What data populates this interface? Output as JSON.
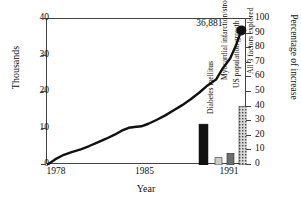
{
  "chart_data": {
    "type": "line",
    "title": "",
    "xlabel": "Year",
    "ylabel": "Thousands",
    "ylabel_right": "Percentage of increase",
    "xlim": [
      1978,
      1992.2
    ],
    "ylim": [
      0,
      40
    ],
    "ylim_right": [
      0,
      100
    ],
    "yticks": [
      0,
      10,
      20,
      30,
      40
    ],
    "yticks_right": [
      0,
      10,
      20,
      30,
      40,
      50,
      60,
      70,
      80,
      90,
      100
    ],
    "xticks": [
      1978,
      1985,
      1991
    ],
    "xtick_labels": [
      "1978",
      "1985",
      "1991"
    ],
    "grid": false,
    "legend": "none",
    "series": [
      {
        "name": "Count (thousands)",
        "axis": "left",
        "marker_end": true,
        "end_label": "36,881",
        "x": [
          1978,
          1978.6,
          1979.2,
          1979.8,
          1980.4,
          1981.0,
          1981.6,
          1982.2,
          1982.8,
          1983.3,
          1983.8,
          1984.2,
          1984.7,
          1985.2,
          1985.8,
          1986.4,
          1987.0,
          1987.6,
          1988.2,
          1988.8,
          1989.4,
          1990.0,
          1990.5,
          1991.0,
          1991.4,
          1991.8
        ],
        "y": [
          0.0,
          1.6,
          2.8,
          3.6,
          4.3,
          5.2,
          6.2,
          7.2,
          8.3,
          9.4,
          10.2,
          10.4,
          10.6,
          11.3,
          12.4,
          13.6,
          15.0,
          16.4,
          18.0,
          19.8,
          21.8,
          23.4,
          26.6,
          29.2,
          32.6,
          36.881
        ]
      }
    ],
    "bars": {
      "axis": "right",
      "unit": "percent",
      "categories": [
        "Diabetes mellitus",
        "Myocardial infarction/stroke",
        "US population growth",
        "All 3 factors explored"
      ],
      "values": [
        28,
        5,
        8,
        40
      ],
      "fills": [
        "solid-black",
        "light-gray",
        "dark-gray",
        "hatched-gray"
      ]
    }
  },
  "annotations": {
    "end_point_value": "36,881"
  }
}
